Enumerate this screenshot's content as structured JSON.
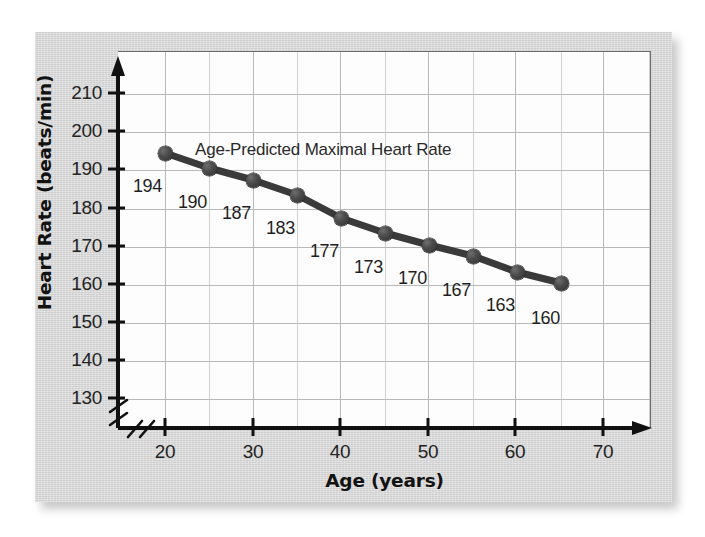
{
  "figure": {
    "panel_background": "#d6d6d6",
    "plot_background": "#fdfdfd",
    "grid_color": "#b9b9b9",
    "axis_color": "#111111",
    "series_color": "#3a3a3a"
  },
  "axes": {
    "y_title": "Heart Rate (beats/min)",
    "x_title": "Age (years)",
    "y_ticks": [
      "210",
      "200",
      "190",
      "180",
      "170",
      "160",
      "150",
      "140",
      "130"
    ],
    "x_ticks": [
      "20",
      "30",
      "40",
      "50",
      "60",
      "70"
    ],
    "y_axis_break": true,
    "x_axis_break": true
  },
  "annotation": {
    "series_label": "Age-Predicted Maximal Heart Rate"
  },
  "chart_data": {
    "type": "line",
    "title": "",
    "subtitle": "",
    "xlabel": "Age (years)",
    "ylabel": "Heart Rate (beats/min)",
    "xlim": [
      15,
      72
    ],
    "ylim": [
      127,
      215
    ],
    "grid": true,
    "legend": "none",
    "series": [
      {
        "name": "Age-Predicted Maximal Heart Rate",
        "x": [
          20,
          25,
          30,
          35,
          40,
          45,
          50,
          55,
          60,
          65
        ],
        "values": [
          194,
          190,
          187,
          183,
          177,
          173,
          170,
          167,
          163,
          160
        ],
        "point_labels": [
          "194",
          "190",
          "187",
          "183",
          "177",
          "173",
          "170",
          "167",
          "163",
          "160"
        ],
        "marker": "filled-circle",
        "color": "#3a3a3a"
      }
    ],
    "x_tick_values": [
      20,
      30,
      40,
      50,
      60,
      70
    ],
    "y_tick_values": [
      130,
      140,
      150,
      160,
      170,
      180,
      190,
      200,
      210
    ],
    "annotations": [
      {
        "text": "Age-Predicted Maximal Heart Rate",
        "x": 33,
        "y": 198
      }
    ]
  },
  "geometry": {
    "y_tick_y_px": [
      93,
      131,
      169,
      208,
      246,
      284,
      322,
      360,
      398
    ],
    "x_tick_x_px": [
      165,
      253,
      340,
      428,
      515,
      603
    ],
    "points_px": [
      {
        "x": 165,
        "y": 153,
        "lx": 133,
        "ly": 176
      },
      {
        "x": 209,
        "y": 168,
        "lx": 178,
        "ly": 192
      },
      {
        "x": 253,
        "y": 180,
        "lx": 222,
        "ly": 203
      },
      {
        "x": 297,
        "y": 195,
        "lx": 266,
        "ly": 218
      },
      {
        "x": 341,
        "y": 218,
        "lx": 310,
        "ly": 241
      },
      {
        "x": 385,
        "y": 233,
        "lx": 354,
        "ly": 257
      },
      {
        "x": 429,
        "y": 245,
        "lx": 398,
        "ly": 268
      },
      {
        "x": 473,
        "y": 256,
        "lx": 442,
        "ly": 280
      },
      {
        "x": 517,
        "y": 272,
        "lx": 486,
        "ly": 295
      },
      {
        "x": 561,
        "y": 283,
        "lx": 531,
        "ly": 308
      }
    ]
  }
}
